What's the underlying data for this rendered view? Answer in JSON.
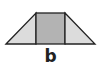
{
  "diagram": {
    "shape": "trapezoid",
    "parts": [
      {
        "name": "left-triangle",
        "fill": "#dcdcdc"
      },
      {
        "name": "center-rectangle",
        "fill": "#b3b3b3"
      },
      {
        "name": "right-triangle",
        "fill": "#dcdcdc"
      }
    ],
    "stroke": "#222222",
    "base_label": "b"
  }
}
